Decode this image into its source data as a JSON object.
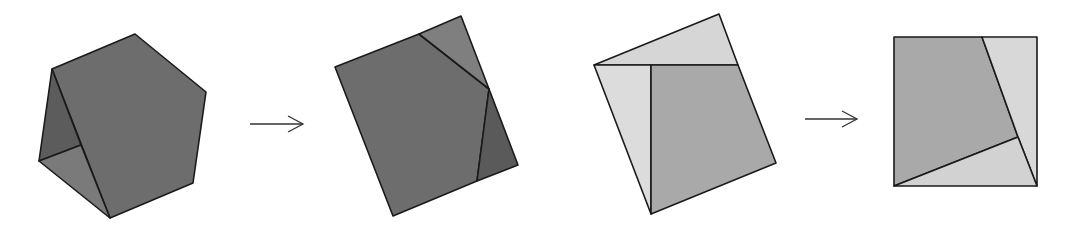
{
  "diagram": {
    "colors": {
      "stroke": "#1a1a1a",
      "dark_face": "#6d6d6d",
      "darker_face": "#5a5a5a",
      "mid_face": "#7f7f7f",
      "light_face": "#d6d6d6",
      "medium_face": "#a9a9a9"
    },
    "figures": [
      {
        "name": "hexagon-folded",
        "pieces": [
          {
            "name": "hexagon-main-face",
            "points": "52,69 135,34 206,92 193,183 110,218",
            "fill": "#6d6d6d"
          },
          {
            "name": "hexagon-inner-back",
            "points": "52,69 81,145 39,161",
            "fill": "#5c5c5c"
          },
          {
            "name": "hexagon-inner-floor",
            "points": "39,161 81,145 110,218",
            "fill": "#7a7a7a"
          }
        ]
      },
      {
        "name": "rectangle-from-hexagon",
        "pieces": [
          {
            "name": "rectangle-main-face",
            "points": "335,67 419,34 489,89 477,181 393,216",
            "fill": "#6d6d6d"
          },
          {
            "name": "rectangle-top-triangle",
            "points": "419,34 461,16 489,89",
            "fill": "#7f7f7f"
          },
          {
            "name": "rectangle-right-piece",
            "points": "489,89 518,165 477,181",
            "fill": "#5a5a5a"
          }
        ]
      },
      {
        "name": "tilted-rectangle",
        "pieces": [
          {
            "name": "tilted-top-triangle",
            "points": "594,65 719,14 738,65",
            "fill": "#d6d6d6"
          },
          {
            "name": "tilted-left-piece",
            "points": "594,65 651,65 651,214",
            "fill": "#dcdcdc"
          },
          {
            "name": "tilted-main-face",
            "points": "651,65 738,65 776,163 651,214",
            "fill": "#a9a9a9"
          }
        ]
      },
      {
        "name": "square-result",
        "pieces": [
          {
            "name": "square-main-face",
            "points": "894,37 982,37 1018,137 894,186",
            "fill": "#a9a9a9"
          },
          {
            "name": "square-right-piece",
            "points": "982,37 1037,37 1037,186 1018,137",
            "fill": "#d8d8d8"
          },
          {
            "name": "square-bottom-triangle",
            "points": "894,186 1018,137 1037,186",
            "fill": "#d2d2d2"
          }
        ]
      }
    ],
    "arrows": [
      {
        "name": "arrow-1",
        "x1": 250,
        "y1": 124,
        "x2": 303,
        "y2": 124
      },
      {
        "name": "arrow-2",
        "x1": 805,
        "y1": 119,
        "x2": 857,
        "y2": 119
      }
    ]
  }
}
